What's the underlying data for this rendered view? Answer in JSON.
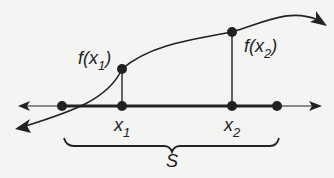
{
  "diagram": {
    "labels": {
      "f_x1": "f(x",
      "f_x1_sub": "1",
      "f_x2": "f(x",
      "f_x2_sub": "2",
      "close_paren": ")",
      "x1": "x",
      "x1_sub": "1",
      "x2": "x",
      "x2_sub": "2",
      "set": "S"
    },
    "colors": {
      "ink": "#222222",
      "background": "#f4f4f2"
    }
  }
}
